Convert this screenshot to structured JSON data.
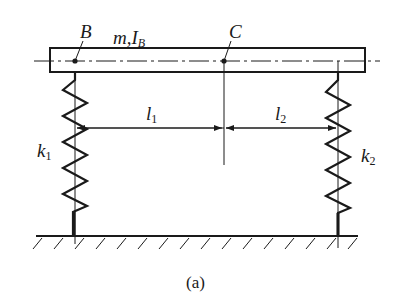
{
  "figure": {
    "caption": "(a)",
    "colors": {
      "ink": "#1a1a1a",
      "background": "#ffffff"
    }
  },
  "labels": {
    "point_b": "B",
    "mass": "m,",
    "inertia_base": "I",
    "inertia_sub": "B",
    "point_c": "C",
    "l1_base": "l",
    "l1_sub": "1",
    "l2_base": "l",
    "l2_sub": "2",
    "k1_base": "k",
    "k1_sub": "1",
    "k2_base": "k",
    "k2_sub": "2"
  },
  "elements": {
    "beam": "rigid bar with mass m and moment of inertia I_B about B",
    "spring_left": "spring k1 attached at point B",
    "spring_right": "spring k2 attached at right end",
    "dimension_l1": "distance from B to C",
    "dimension_l2": "distance from C to right spring",
    "ground": "fixed hatched ground"
  }
}
